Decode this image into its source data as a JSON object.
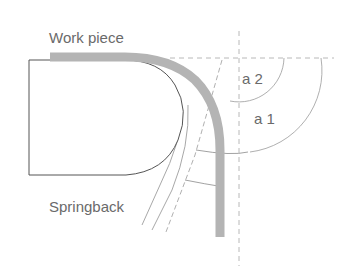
{
  "diagram": {
    "labels": {
      "work_piece": "Work piece",
      "springback": "Springback",
      "angle_2": "a 2",
      "angle_1": "a 1"
    },
    "colors": {
      "work_piece_fill": "#b4b4b4",
      "outline": "#555555",
      "dashed": "#b8b8b8",
      "arc": "#9a9a9a",
      "text": "#6a6a6a"
    }
  }
}
